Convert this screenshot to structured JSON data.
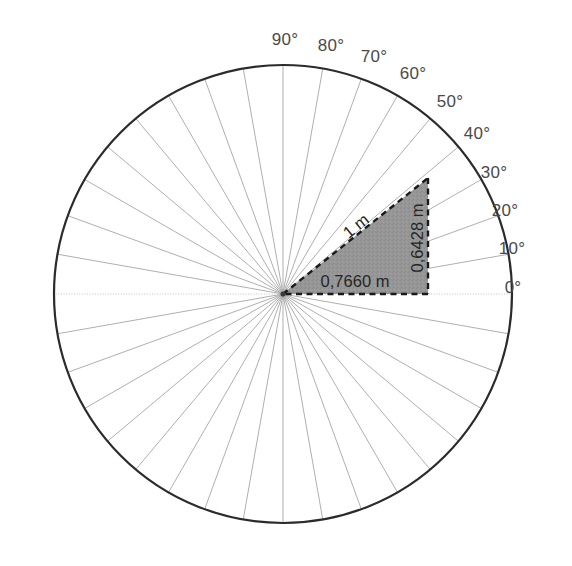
{
  "figure": {
    "background_color": "#ffffff"
  },
  "chart_data": {
    "type": "scatter",
    "title": "",
    "xlabel": "",
    "ylabel": "",
    "subtype": "polar-protractor-diagram",
    "grid": true,
    "legend": null,
    "circle": {
      "center_x": 283,
      "center_y": 294,
      "radius": 229,
      "stroke_color": "#2b2b2b",
      "stroke_width": 2.2,
      "fill": "none"
    },
    "spokes": {
      "count": 36,
      "step_degrees": 10,
      "start_degrees": 0,
      "stroke_color": "#9a9a9a",
      "stroke_width": 0.8
    },
    "angle_ticks": [
      0,
      10,
      20,
      30,
      40,
      50,
      60,
      70,
      80,
      90
    ],
    "angle_labels": [
      {
        "value": 0,
        "text": "0°",
        "x": 513,
        "y": 288
      },
      {
        "value": 10,
        "text": "10°",
        "x": 512,
        "y": 249
      },
      {
        "value": 20,
        "text": "20°",
        "x": 505,
        "y": 211
      },
      {
        "value": 30,
        "text": "30°",
        "x": 494,
        "y": 173
      },
      {
        "value": 40,
        "text": "40°",
        "x": 477,
        "y": 134
      },
      {
        "value": 50,
        "text": "50°",
        "x": 450,
        "y": 102
      },
      {
        "value": 60,
        "text": "60°",
        "x": 413,
        "y": 74
      },
      {
        "value": 70,
        "text": "70°",
        "x": 374,
        "y": 57
      },
      {
        "value": 80,
        "text": "80°",
        "x": 331,
        "y": 46
      },
      {
        "value": 90,
        "text": "90°",
        "x": 285,
        "y": 40
      }
    ],
    "triangle": {
      "angle_degrees": 40,
      "hypotenuse_value": 1,
      "hypotenuse_unit": "m",
      "opposite_value": 0.6428,
      "adjacent_value": 0.766,
      "vertex_center": [
        283,
        294
      ],
      "vertex_apex": [
        428,
        178
      ],
      "vertex_corner": [
        428,
        294
      ],
      "fill_color": "#969696",
      "fill_opacity": 1,
      "edge_color": "#1a1a1a",
      "edge_style": "dashed",
      "edge_width": 2.4,
      "labels": {
        "hypotenuse": "1 m",
        "opposite": "0,6428 m",
        "adjacent": "0,7660 m"
      },
      "label_positions": {
        "hypotenuse": {
          "x": 356,
          "y": 226,
          "rotation": -38.7
        },
        "opposite": {
          "x": 417,
          "y": 238,
          "rotation": -90
        },
        "adjacent": {
          "x": 355,
          "y": 281,
          "rotation": 0
        }
      }
    },
    "colors": {
      "outline": "#2b2b2b",
      "spoke": "#9a9a9a",
      "triangle_fill": "#969696",
      "triangle_edge": "#1a1a1a",
      "label_text": "#4a4a4a",
      "dimension_text": "#262626",
      "background": "#ffffff"
    }
  }
}
